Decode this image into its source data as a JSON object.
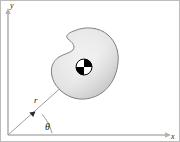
{
  "figure": {
    "background_color": "#ffffff",
    "border_color": "#b8b8b8",
    "axes": {
      "y_label": "y",
      "x_label": "x",
      "axis_color": "#b0b0b0",
      "origin": {
        "x": 8,
        "y": 135
      }
    },
    "polar": {
      "radius_label": "r",
      "angle_label": "θ",
      "ray_color": "#9a9a9a",
      "arc_color": "#9a9a9a"
    },
    "body": {
      "name": "rigid-body-blob",
      "outline_color": "#6e6e6e",
      "fill_light": "#ffffff",
      "fill_mid": "#e2e2e2",
      "fill_dark": "#b9b9b9"
    },
    "center_of_mass": {
      "symbol": "center-of-mass",
      "dark_color": "#000000",
      "light_color": "#ffffff",
      "ring_color": "#000000",
      "position": {
        "x": 84,
        "y": 67
      },
      "radius": 7
    }
  }
}
